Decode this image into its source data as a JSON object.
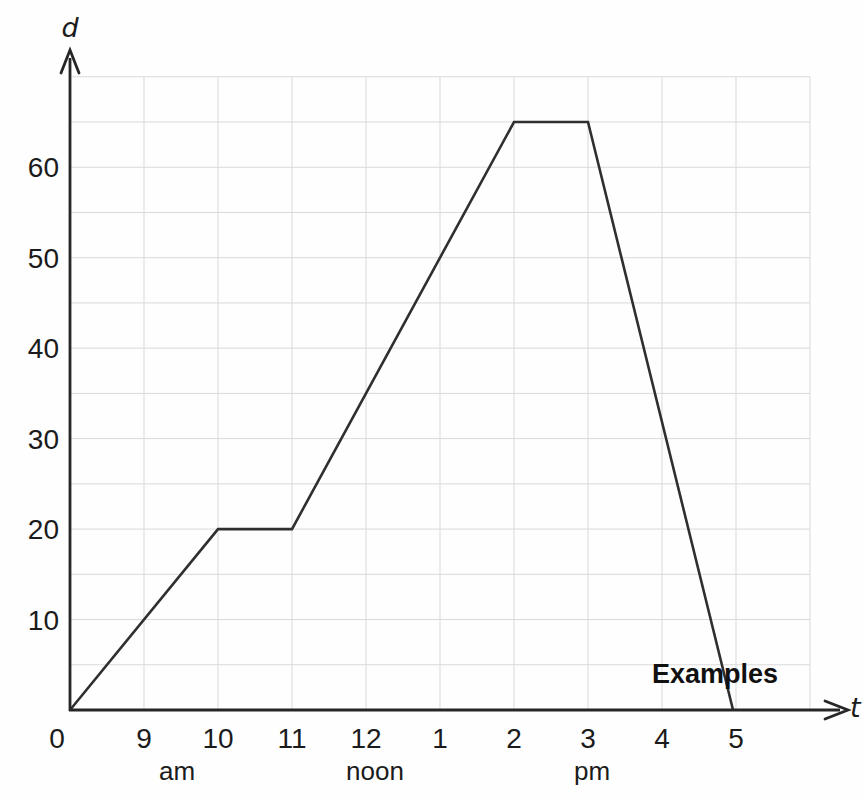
{
  "chart_data": {
    "type": "line",
    "title": "",
    "x_axis": {
      "label": "t",
      "origin_label": "0",
      "unit": "hours after 8 am (origin = 0)",
      "ticks": [
        {
          "label": "9",
          "hour": 1
        },
        {
          "label": "10",
          "hour": 2
        },
        {
          "label": "11",
          "hour": 3
        },
        {
          "label": "12",
          "hour": 4
        },
        {
          "label": "1",
          "hour": 5
        },
        {
          "label": "2",
          "hour": 6
        },
        {
          "label": "3",
          "hour": 7
        },
        {
          "label": "4",
          "hour": 8
        },
        {
          "label": "5",
          "hour": 9
        }
      ],
      "period_labels": [
        {
          "text": "am",
          "hour": 1.45
        },
        {
          "text": "noon",
          "hour": 4.12
        },
        {
          "text": "pm",
          "hour": 7.05
        }
      ],
      "xlim": [
        0,
        10.5
      ]
    },
    "y_axis": {
      "label": "d",
      "ticks": [
        10,
        20,
        30,
        40,
        50,
        60
      ],
      "ylim": [
        0,
        72
      ]
    },
    "grid": {
      "show": true,
      "x_step_hours": 1,
      "x_max_hours": 10,
      "y_step": 5,
      "y_max": 70
    },
    "series": [
      {
        "name": "journey",
        "points": [
          {
            "hour": 0,
            "d": 0
          },
          {
            "hour": 2,
            "d": 20
          },
          {
            "hour": 3,
            "d": 20
          },
          {
            "hour": 6,
            "d": 65
          },
          {
            "hour": 7,
            "d": 65
          },
          {
            "hour": 8.96,
            "d": 0
          }
        ]
      }
    ],
    "annotation": {
      "text": "Examples"
    },
    "colors": {
      "line": "#2f2f2f",
      "axis": "#262626",
      "grid": "#d9d9d9",
      "text": "#1b1b1b"
    }
  }
}
